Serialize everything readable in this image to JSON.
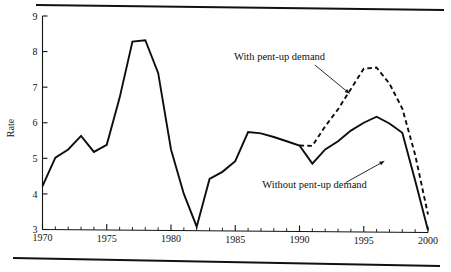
{
  "chart_data": {
    "type": "line",
    "title": "",
    "xlabel": "",
    "ylabel": "Rate",
    "xlim": [
      1970,
      2000
    ],
    "ylim": [
      3,
      9
    ],
    "grid": false,
    "legend_position": "inline-annotations",
    "x_ticks": [
      1970,
      1975,
      1980,
      1985,
      1990,
      1995,
      2000
    ],
    "x_tick_labels": [
      "1970",
      "1975",
      "1980",
      "1985",
      "1990",
      "1995",
      "2000"
    ],
    "x_minor_tick_step": 1,
    "y_ticks": [
      3,
      4,
      5,
      6,
      7,
      8,
      9
    ],
    "y_tick_labels": [
      "3",
      "4",
      "5",
      "6",
      "7",
      "8",
      "9"
    ],
    "series": [
      {
        "name": "Without pent-up demand",
        "style": "solid",
        "color": "#0d0d0d",
        "x": [
          1970,
          1971,
          1972,
          1973,
          1974,
          1975,
          1976,
          1977,
          1978,
          1979,
          1980,
          1981,
          1982,
          1983,
          1984,
          1985,
          1986,
          1987,
          1988,
          1989,
          1990,
          1991,
          1992,
          1993,
          1994,
          1995,
          1996,
          1997,
          1998,
          1999,
          2000
        ],
        "values": [
          4.22,
          5.02,
          5.25,
          5.63,
          5.18,
          5.38,
          6.7,
          8.28,
          8.32,
          7.4,
          5.25,
          4.0,
          3.08,
          4.42,
          4.62,
          4.92,
          5.74,
          5.7,
          5.6,
          5.48,
          5.36,
          4.85,
          5.25,
          5.48,
          5.78,
          6.0,
          6.17,
          5.98,
          5.72,
          4.38,
          2.98
        ]
      },
      {
        "name": "With pent-up demand",
        "style": "dashed",
        "color": "#0d0d0d",
        "x": [
          1990,
          1991,
          1992,
          1993,
          1994,
          1995,
          1996,
          1997,
          1998,
          1999,
          2000
        ],
        "values": [
          5.36,
          5.35,
          5.9,
          6.38,
          6.95,
          7.52,
          7.55,
          7.1,
          6.4,
          5.1,
          3.42
        ]
      }
    ],
    "annotations": [
      {
        "label": "With pent-up demand",
        "text_x": 1984.9,
        "text_y": 7.75,
        "leader_from_x": 1991.2,
        "leader_from_y": 7.62,
        "leader_to_x": 1993.9,
        "leader_to_y": 6.82
      },
      {
        "label": "Without pent-up demand",
        "text_x": 1987.1,
        "text_y": 4.18,
        "leader_from_x": 1993.6,
        "leader_from_y": 4.32,
        "leader_to_x": 1996.6,
        "leader_to_y": 4.92
      }
    ]
  }
}
